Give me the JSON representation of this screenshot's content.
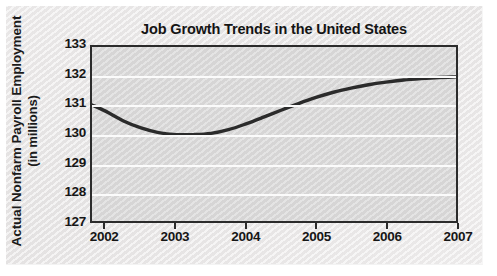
{
  "chart_data": {
    "type": "line",
    "title": "Job Growth Trends in the United States",
    "xlabel": "",
    "ylabel": "Actual Nonfarm Payroll Employment (in millions)",
    "ylabel_line1": "Actual Nonfarm Payroll Employment",
    "ylabel_line2": "(in millions)",
    "xlim": [
      2001.8,
      2007.0
    ],
    "ylim": [
      127,
      133
    ],
    "yticks": [
      133,
      132,
      131,
      130,
      129,
      128,
      127
    ],
    "ytick_labels": [
      "133",
      "132",
      "131",
      "130",
      "129",
      "128",
      "127"
    ],
    "xticks": [
      2002,
      2003,
      2004,
      2005,
      2006,
      2007
    ],
    "xtick_labels": [
      "2002",
      "2003",
      "2004",
      "2005",
      "2006",
      "2007"
    ],
    "grid": "horizontal",
    "legend": "none",
    "series": [
      {
        "name": "Actual Nonfarm Payroll Employment",
        "color": "#2b2b2b",
        "x": [
          2001.8,
          2002.0,
          2002.25,
          2002.5,
          2002.75,
          2003.0,
          2003.25,
          2003.5,
          2003.75,
          2004.0,
          2004.25,
          2004.5,
          2004.75,
          2005.0,
          2005.25,
          2005.5,
          2005.75,
          2006.0,
          2006.25,
          2006.5,
          2006.75,
          2007.0
        ],
        "values": [
          131.0,
          130.78,
          130.45,
          130.21,
          130.05,
          129.98,
          129.98,
          130.02,
          130.15,
          130.35,
          130.58,
          130.82,
          131.05,
          131.26,
          131.44,
          131.58,
          131.7,
          131.79,
          131.86,
          131.91,
          131.95,
          131.97
        ]
      }
    ],
    "colors": {
      "line": "#2b2b2b",
      "plot_background": "#d9d8d8",
      "gridline": "#fbfbfb",
      "axis": "#2b2b2b",
      "text": "#161616",
      "paper": "#eae8e8"
    }
  }
}
